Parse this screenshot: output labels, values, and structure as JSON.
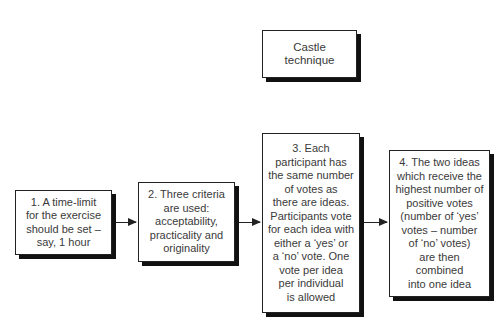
{
  "title": "Castle technique",
  "steps": [
    {
      "label": "1. A time-limit\nfor the exercise\nshould be set –\nsay, 1 hour"
    },
    {
      "label": "2. Three criteria\nare used:\nacceptability,\npracticality and\noriginality"
    },
    {
      "label": "3. Each\nparticipant has\nthe same number\nof votes as\nthere are ideas.\nParticipants vote\nfor each idea with\neither a ‘yes’ or\na ‘no’ vote. One\nvote per idea\nper individual\nis allowed"
    },
    {
      "label": "4. The two ideas\nwhich receive the\nhighest number of\npositive votes\n(number of ‘yes’\nvotes – number\nof ‘no’ votes)\nare then\ncombined\ninto one idea"
    }
  ],
  "colors": {
    "border": "#222222",
    "shadow": "#111111",
    "text": "#3a3a3a"
  }
}
